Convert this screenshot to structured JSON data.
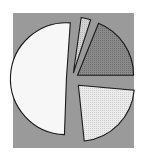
{
  "figure": {
    "width": 147,
    "height": 161,
    "page_background": "#ffffff",
    "plot_background": "#9a9a9a",
    "plot_rect": {
      "x": 13,
      "y": 13,
      "width": 121,
      "height": 135
    },
    "outline_color": "#1a1a1a"
  },
  "chart_data": {
    "type": "pie",
    "title": "",
    "subtitle": "",
    "xlabel": "",
    "ylabel": "",
    "grid": false,
    "legend": "none",
    "exploded": true,
    "start_angle_deg": 8,
    "direction": "clockwise",
    "center": {
      "cx": 72,
      "cy": 79
    },
    "radius": 56,
    "categories": [
      "Slice 1",
      "Slice 2",
      "Slice 3",
      "Slice 4"
    ],
    "values": [
      3,
      19,
      22,
      56
    ],
    "labels": [
      "",
      "",
      "",
      ""
    ],
    "slices": [
      {
        "name": "Slice 1",
        "value": 3,
        "percent": 3,
        "start_angle_deg": 8,
        "end_angle_deg": 18,
        "fill": "#cfcfcf",
        "pattern": "dots",
        "explode": 0.11
      },
      {
        "name": "Slice 2",
        "value": 19,
        "percent": 19,
        "start_angle_deg": 22,
        "end_angle_deg": 90,
        "fill": "#8a8a8a",
        "pattern": "dots",
        "explode": 0.12
      },
      {
        "name": "Slice 3",
        "value": 22,
        "percent": 22,
        "start_angle_deg": 95,
        "end_angle_deg": 174,
        "fill": "#e4e4e4",
        "pattern": "dots",
        "explode": 0.16
      },
      {
        "name": "Slice 4",
        "value": 56,
        "percent": 56,
        "start_angle_deg": 182,
        "end_angle_deg": 364,
        "fill": "#f7f7f7",
        "pattern": "solid",
        "explode": 0.1
      }
    ]
  }
}
